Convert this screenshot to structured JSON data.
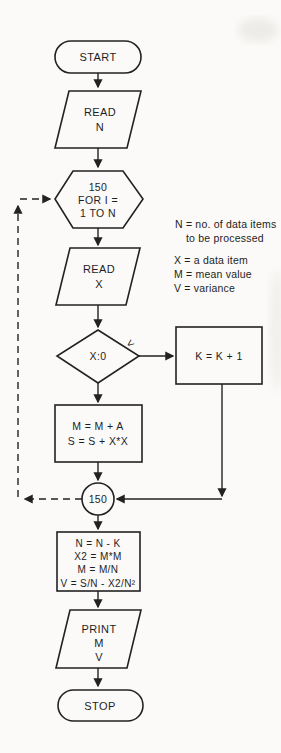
{
  "palette": {
    "paper": "#fbfaf8",
    "ink": "#1e1e1e"
  },
  "flowchart": {
    "start": {
      "label": "START"
    },
    "read_n": {
      "lines": [
        "READ",
        "N"
      ]
    },
    "loop": {
      "lines": [
        "150",
        "FOR I =",
        "1 TO N"
      ]
    },
    "read_x": {
      "lines": [
        "READ",
        "X"
      ]
    },
    "decision": {
      "label": "X:0",
      "branch_label": "<"
    },
    "increment": {
      "label": "K = K + 1"
    },
    "accumulate": {
      "lines": [
        "M = M + A",
        "S = S + X*X"
      ]
    },
    "connector": {
      "label": "150"
    },
    "compute": {
      "lines": [
        "N = N - K",
        "X2 = M*M",
        "M = M/N",
        "V = S/N - X2/N²"
      ]
    },
    "print": {
      "lines": [
        "PRINT",
        "M",
        "V"
      ]
    },
    "stop": {
      "label": "STOP"
    }
  },
  "legend": {
    "line1": "N = no. of data items",
    "line2": "to be processed",
    "line3": "X = a data item",
    "line4": "M = mean value",
    "line5": "V = variance"
  }
}
